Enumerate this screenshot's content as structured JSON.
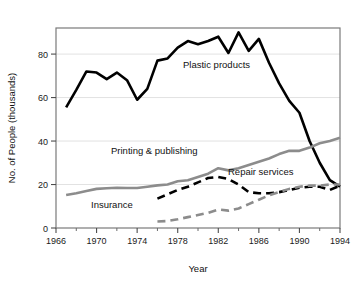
{
  "chart_data": {
    "type": "line",
    "title": "",
    "xlabel": "Year",
    "ylabel": "No. of People (thousands)",
    "xlim": [
      1966,
      1994
    ],
    "ylim": [
      0,
      92
    ],
    "grid": true,
    "grid_axis": "y",
    "legend": "inline-annotations",
    "xticks": [
      1966,
      1970,
      1974,
      1978,
      1982,
      1986,
      1990,
      1994
    ],
    "xtick_labels": [
      "1966",
      "1970",
      "1974",
      "1978",
      "1982",
      "1986",
      "1990",
      "1994"
    ],
    "xminorticks": [
      1968,
      1972,
      1976,
      1980,
      1984,
      1988,
      1992
    ],
    "yticks": [
      0,
      20,
      40,
      60,
      80
    ],
    "ytick_labels": [
      "0",
      "20",
      "40",
      "60",
      "80"
    ],
    "series": [
      {
        "name": "Plastic products",
        "color": "#000000",
        "style": "solid",
        "width": 2.6,
        "x": [
          1967,
          1968,
          1969,
          1970,
          1971,
          1972,
          1973,
          1974,
          1975,
          1976,
          1977,
          1978,
          1979,
          1980,
          1981,
          1982,
          1983,
          1984,
          1985,
          1986,
          1987,
          1988,
          1989,
          1990,
          1991,
          1992,
          1993,
          1994
        ],
        "values": [
          55.5,
          63.5,
          72.0,
          71.5,
          68.5,
          71.5,
          68.0,
          59.0,
          64.0,
          77.0,
          78.0,
          83.0,
          86.0,
          84.5,
          86.0,
          88.0,
          80.5,
          90.0,
          81.5,
          87.0,
          76.0,
          66.5,
          58.5,
          53.0,
          40.0,
          30.0,
          22.0,
          19.0
        ]
      },
      {
        "name": "Printing & publishing",
        "color": "#8c8c8c",
        "style": "solid",
        "width": 2.6,
        "x": [
          1967,
          1968,
          1969,
          1970,
          1971,
          1972,
          1973,
          1974,
          1975,
          1976,
          1977,
          1978,
          1979,
          1980,
          1981,
          1982,
          1983,
          1984,
          1985,
          1986,
          1987,
          1988,
          1989,
          1990,
          1991,
          1992,
          1993,
          1994
        ],
        "values": [
          15.2,
          16.0,
          17.0,
          18.0,
          18.3,
          18.5,
          18.4,
          18.4,
          19.0,
          19.6,
          20.0,
          21.5,
          22.0,
          23.5,
          25.0,
          27.5,
          26.5,
          27.5,
          29.0,
          30.5,
          32.0,
          34.0,
          35.5,
          35.5,
          37.0,
          39.0,
          40.0,
          41.5
        ]
      },
      {
        "name": "Repair services",
        "color": "#000000",
        "style": "dashed",
        "width": 2.6,
        "dash": "8,5",
        "x": [
          1976,
          1977,
          1978,
          1979,
          1980,
          1981,
          1982,
          1983,
          1984,
          1985,
          1986,
          1987,
          1988,
          1989,
          1990,
          1991,
          1992,
          1993,
          1994
        ],
        "values": [
          13.5,
          15.5,
          17.5,
          19.0,
          21.0,
          23.0,
          23.5,
          22.5,
          20.0,
          16.5,
          16.0,
          16.0,
          16.5,
          17.5,
          18.5,
          19.0,
          19.0,
          17.5,
          19.5
        ]
      },
      {
        "name": "Insurance",
        "color": "#8c8c8c",
        "style": "dashed",
        "width": 2.6,
        "dash": "8,5",
        "x": [
          1976,
          1977,
          1978,
          1979,
          1980,
          1981,
          1982,
          1983,
          1984,
          1985,
          1986,
          1987,
          1988,
          1989,
          1990,
          1991,
          1992,
          1993,
          1994
        ],
        "values": [
          3.0,
          3.2,
          4.0,
          5.0,
          6.0,
          7.0,
          8.5,
          8.0,
          9.0,
          11.0,
          13.0,
          15.0,
          16.5,
          18.0,
          19.0,
          19.5,
          19.5,
          20.0,
          20.0
        ]
      }
    ],
    "annotations": [
      {
        "text": "Plastic products",
        "x_px": 183,
        "y_px": 68,
        "anchor": "start"
      },
      {
        "text": "Printing & publishing",
        "x_px": 111,
        "y_px": 154,
        "anchor": "start"
      },
      {
        "text": "Repair services",
        "x_px": 228,
        "y_px": 175,
        "anchor": "start"
      },
      {
        "text": "Insurance",
        "x_px": 91,
        "y_px": 208,
        "anchor": "start"
      }
    ]
  }
}
